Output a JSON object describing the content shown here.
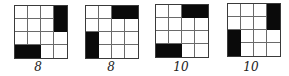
{
  "figure": {
    "grid_size": 4,
    "panels": [
      {
        "label": "8",
        "blocks": [
          {
            "orientation": "vertical",
            "col": 3,
            "row": 0,
            "length": 2
          },
          {
            "orientation": "horizontal",
            "col": 0,
            "row": 3,
            "length": 2
          }
        ]
      },
      {
        "label": "8",
        "blocks": [
          {
            "orientation": "horizontal",
            "col": 2,
            "row": 0,
            "length": 2
          },
          {
            "orientation": "vertical",
            "col": 0,
            "row": 2,
            "length": 2
          }
        ]
      },
      {
        "label": "10",
        "blocks": [
          {
            "orientation": "horizontal",
            "col": 2,
            "row": 0,
            "length": 2
          },
          {
            "orientation": "horizontal",
            "col": 0,
            "row": 3,
            "length": 2
          }
        ]
      },
      {
        "label": "10",
        "blocks": [
          {
            "orientation": "vertical",
            "col": 3,
            "row": 0,
            "length": 2
          },
          {
            "orientation": "vertical",
            "col": 0,
            "row": 2,
            "length": 2
          }
        ]
      }
    ]
  }
}
